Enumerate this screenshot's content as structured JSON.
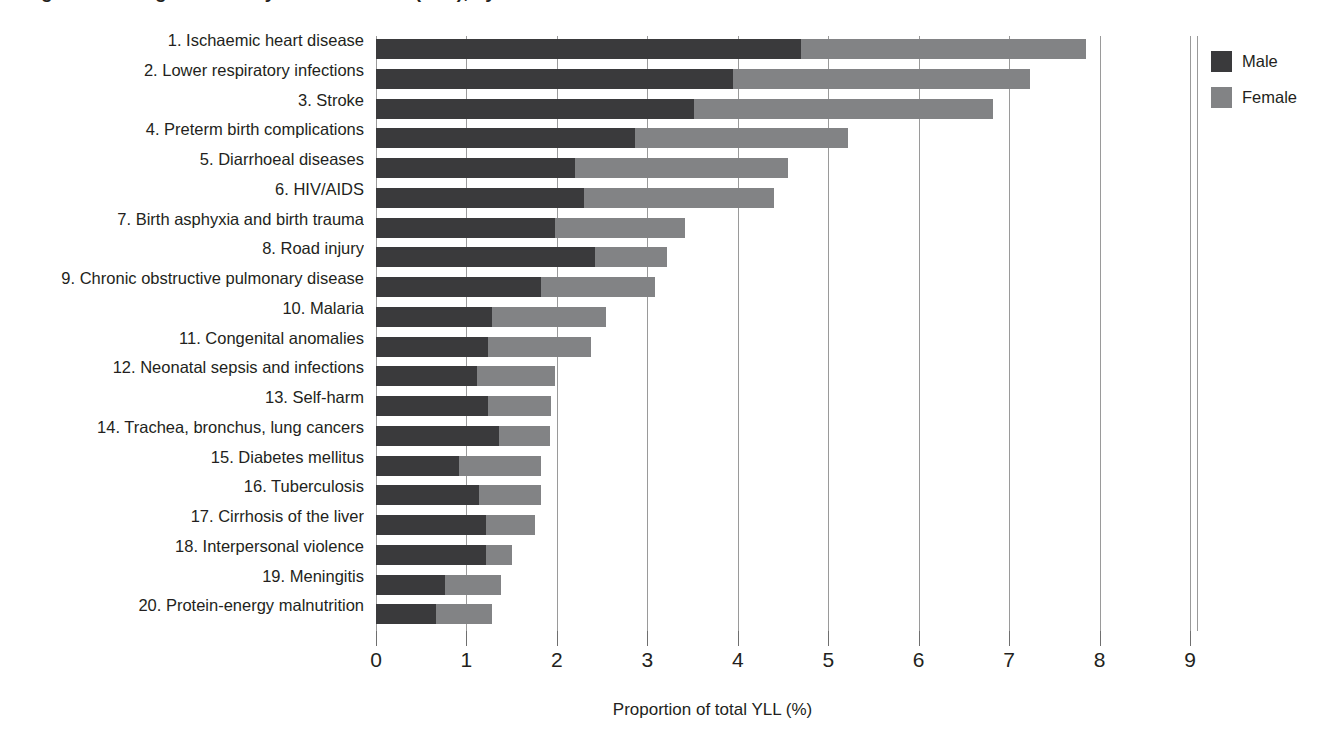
{
  "title": "Figure: Leading causes of years of life lost (YLL), by sex",
  "chart_data": {
    "type": "bar",
    "orientation": "horizontal",
    "stacked": true,
    "title": "",
    "xlabel": "Proportion of total YLL (%)",
    "ylabel": "",
    "xlim": [
      0,
      9
    ],
    "xticks": [
      "0",
      "1",
      "2",
      "3",
      "4",
      "5",
      "6",
      "7",
      "8",
      "9"
    ],
    "grid": "vertical",
    "legend_position": "right",
    "categories": [
      "1. Ischaemic heart disease",
      "2. Lower respiratory infections",
      "3. Stroke",
      "4. Preterm birth complications",
      "5. Diarrhoeal diseases",
      "6. HIV/AIDS",
      "7. Birth asphyxia and birth trauma",
      "8. Road injury",
      "9. Chronic obstructive pulmonary disease",
      "10. Malaria",
      "11. Congenital anomalies",
      "12. Neonatal sepsis and infections",
      "13. Self-harm",
      "14. Trachea, bronchus, lung cancers",
      "15. Diabetes mellitus",
      "16. Tuberculosis",
      "17. Cirrhosis of the liver",
      "18. Interpersonal violence",
      "19. Meningitis",
      "20. Protein-energy malnutrition"
    ],
    "series": [
      {
        "name": "Male",
        "color": "#3a3a3c",
        "values": [
          4.7,
          3.95,
          3.52,
          2.86,
          2.2,
          2.3,
          1.98,
          2.42,
          1.82,
          1.28,
          1.24,
          1.12,
          1.24,
          1.36,
          0.92,
          1.14,
          1.22,
          1.22,
          0.76,
          0.66
        ]
      },
      {
        "name": "Female",
        "color": "#828385",
        "values": [
          3.15,
          3.28,
          3.3,
          2.36,
          2.36,
          2.1,
          1.44,
          0.8,
          1.26,
          1.26,
          1.14,
          0.86,
          0.7,
          0.56,
          0.9,
          0.68,
          0.54,
          0.28,
          0.62,
          0.62
        ]
      }
    ],
    "totals": [
      7.85,
      7.23,
      6.82,
      5.22,
      4.56,
      4.4,
      3.42,
      3.22,
      3.08,
      2.54,
      2.38,
      1.98,
      1.94,
      1.92,
      1.82,
      1.82,
      1.76,
      1.5,
      1.38,
      1.28
    ]
  },
  "legend": {
    "items": [
      {
        "label": "Male",
        "color": "#3a3a3c"
      },
      {
        "label": "Female",
        "color": "#828385"
      }
    ]
  }
}
